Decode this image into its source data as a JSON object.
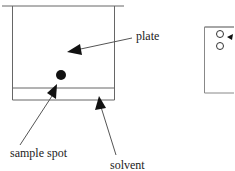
{
  "diagram": {
    "type": "thin-layer-chromatography setup",
    "labels": {
      "plate": "plate",
      "sample_spot": "sample spot",
      "solvent": "solvent"
    },
    "colors": {
      "line": "#555555",
      "ink": "#111111",
      "background": "#ffffff"
    },
    "second_panel": {
      "spots": 2,
      "description": "developed plate with two hollow spots"
    }
  }
}
